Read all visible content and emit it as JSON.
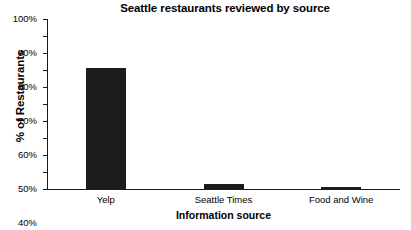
{
  "chart_data": {
    "type": "bar",
    "title": "Seattle restaurants reviewed by source",
    "xlabel": "Information source",
    "ylabel": "% of Restaurants",
    "categories": [
      "Yelp",
      "Seattle Times",
      "Food and Wine"
    ],
    "values": [
      71,
      3,
      1
    ],
    "value_unit": "%",
    "ylim": [
      0,
      100
    ],
    "ytick_step": 10,
    "ytick_labels": [
      "100%",
      "90%",
      "80%",
      "70%",
      "60%",
      "50%",
      "40%",
      "30%",
      "20%",
      "10%",
      "0%"
    ],
    "ytick_values": [
      100,
      90,
      80,
      70,
      60,
      50,
      40,
      30,
      20,
      10,
      0
    ],
    "grid": false,
    "legend": false,
    "series": [
      {
        "name": "% of Restaurants",
        "color": "#1c1c1c",
        "values": [
          71,
          3,
          1
        ]
      }
    ],
    "bar_color": "#1c1c1c",
    "background_color": "#ffffff",
    "axis_color": "#1a1a1a"
  }
}
